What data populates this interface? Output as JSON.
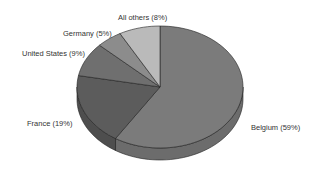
{
  "chart_data": {
    "type": "pie",
    "style": "3d",
    "title": "",
    "start_angle": "12 o'clock",
    "direction": "clockwise",
    "slices": [
      {
        "label": "Belgium (59%)",
        "name": "Belgium",
        "value": 59,
        "color": "#7b7b7b",
        "side_color": "#6c6c6c"
      },
      {
        "label": "France (19%)",
        "name": "France",
        "value": 19,
        "color": "#5c5c5c",
        "side_color": "#4e4e4e"
      },
      {
        "label": "United States (9%)",
        "name": "United States",
        "value": 9,
        "color": "#6f6f6f",
        "side_color": "#606060"
      },
      {
        "label": "Germany (5%)",
        "name": "Germany",
        "value": 5,
        "color": "#8c8c8c",
        "side_color": "#7c7c7c"
      },
      {
        "label": "All others (8%)",
        "name": "All others",
        "value": 8,
        "color": "#bababa",
        "side_color": "#a8a8a8"
      }
    ],
    "legend": "none (labels placed beside slices)"
  },
  "labels": {
    "belgium": "Belgium (59%)",
    "france": "France (19%)",
    "united_states": "United States (9%)",
    "germany": "Germany (5%)",
    "all_others": "All others (8%)"
  }
}
